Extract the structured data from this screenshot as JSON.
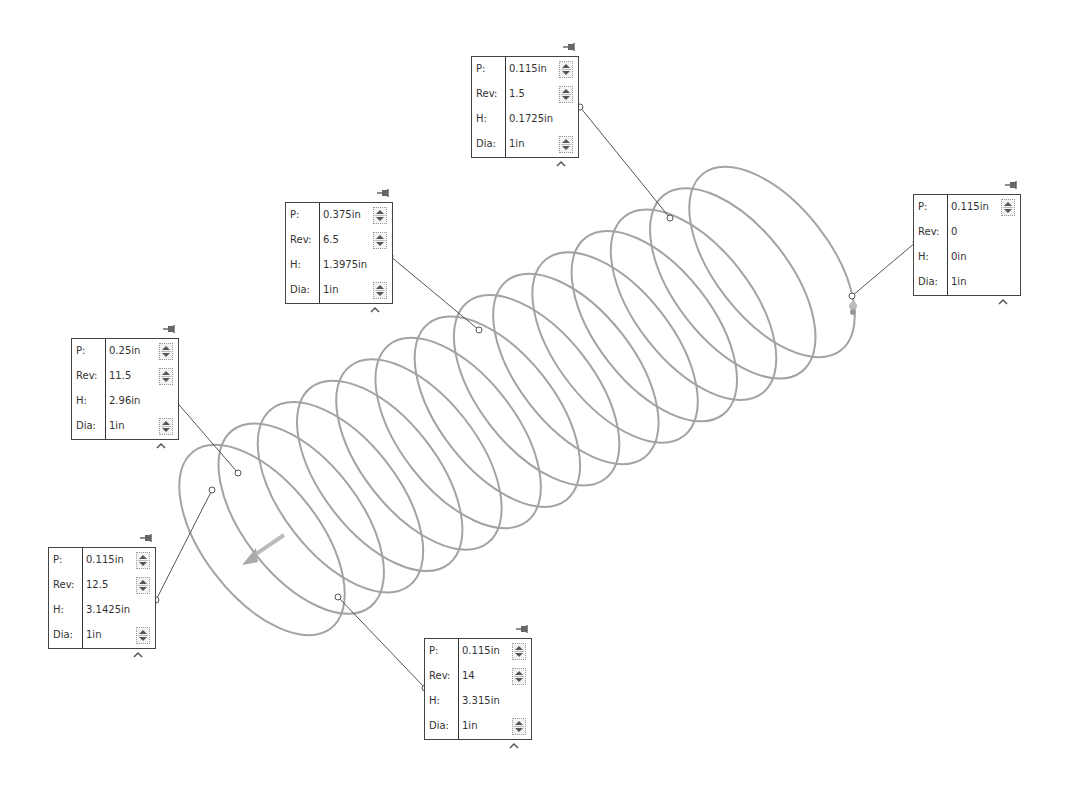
{
  "view": "helix-spring-variable-pitch-table",
  "colors": {
    "spring": "#a0a0a0",
    "leader": "#555555",
    "border": "#444444",
    "text": "#333333"
  },
  "labels": {
    "pitch": "P:",
    "revolutions": "Rev:",
    "height": "H:",
    "diameter": "Dia:"
  },
  "callouts": [
    {
      "id": "c1",
      "P": "0.115in",
      "Rev": "1.5",
      "H": "0.1725in",
      "Dia": "1in",
      "spin": [
        true,
        true,
        false,
        true
      ]
    },
    {
      "id": "c2",
      "P": "0.375in",
      "Rev": "6.5",
      "H": "1.3975in",
      "Dia": "1in",
      "spin": [
        true,
        true,
        false,
        true
      ]
    },
    {
      "id": "c3",
      "P": "0.115in",
      "Rev": "0",
      "H": "0in",
      "Dia": "1in",
      "spin": [
        true,
        false,
        false,
        false
      ]
    },
    {
      "id": "c4",
      "P": "0.25in",
      "Rev": "11.5",
      "H": "2.96in",
      "Dia": "1in",
      "spin": [
        true,
        true,
        false,
        true
      ]
    },
    {
      "id": "c5",
      "P": "0.115in",
      "Rev": "12.5",
      "H": "3.1425in",
      "Dia": "1in",
      "spin": [
        true,
        true,
        false,
        true
      ]
    },
    {
      "id": "c6",
      "P": "0.115in",
      "Rev": "14",
      "H": "3.315in",
      "Dia": "1in",
      "spin": [
        true,
        true,
        false,
        true
      ]
    }
  ],
  "icons": {
    "pin": "pin-icon",
    "collapse": "caret-up-icon",
    "spinner": "spinner-icon",
    "direction_arrow": "arrow-icon"
  }
}
